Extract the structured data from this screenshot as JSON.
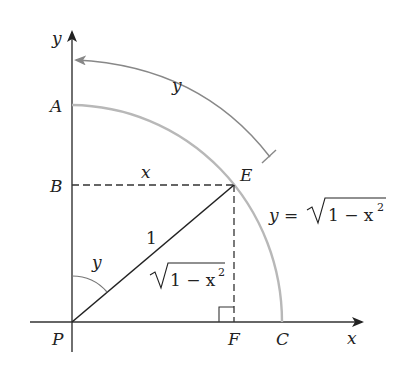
{
  "diagram": {
    "type": "geometry",
    "points": {
      "P": "P",
      "A": "A",
      "B": "B",
      "E": "E",
      "F": "F",
      "C": "C"
    },
    "axes": {
      "x_label": "x",
      "y_label": "y"
    },
    "labels": {
      "arc_length": "y",
      "segment_BE": "x",
      "segment_PE": "1",
      "segment_EF_radical": "1 − x",
      "segment_EF_exp": "2",
      "angle_at_P": "y",
      "curve_eq_lhs": "y =",
      "curve_eq_radical": "1 − x",
      "curve_eq_exp": "2"
    },
    "colors": {
      "axis": "#333333",
      "arc": "#b5b5b5",
      "arrow_arc": "#8a8a8a",
      "text": "#222222"
    }
  }
}
